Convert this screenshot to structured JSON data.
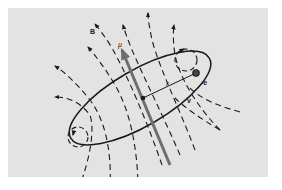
{
  "figure": {
    "colors": {
      "background": "#ffffff",
      "panel": "#e3e3e3",
      "ink": "#1a1a1a",
      "moment_arrow": "#6e6e6e"
    },
    "labels": {
      "field": "B",
      "moment": "μ",
      "radius": "r",
      "charge": "-e",
      "velocity": "v"
    },
    "elements": {
      "current_loop": "ellipse",
      "field_lines": "dashed-arrows",
      "end_loops": "dashed-circles",
      "magnetic_moment": "thick-gray-arrow",
      "electron": "filled-dot"
    }
  }
}
